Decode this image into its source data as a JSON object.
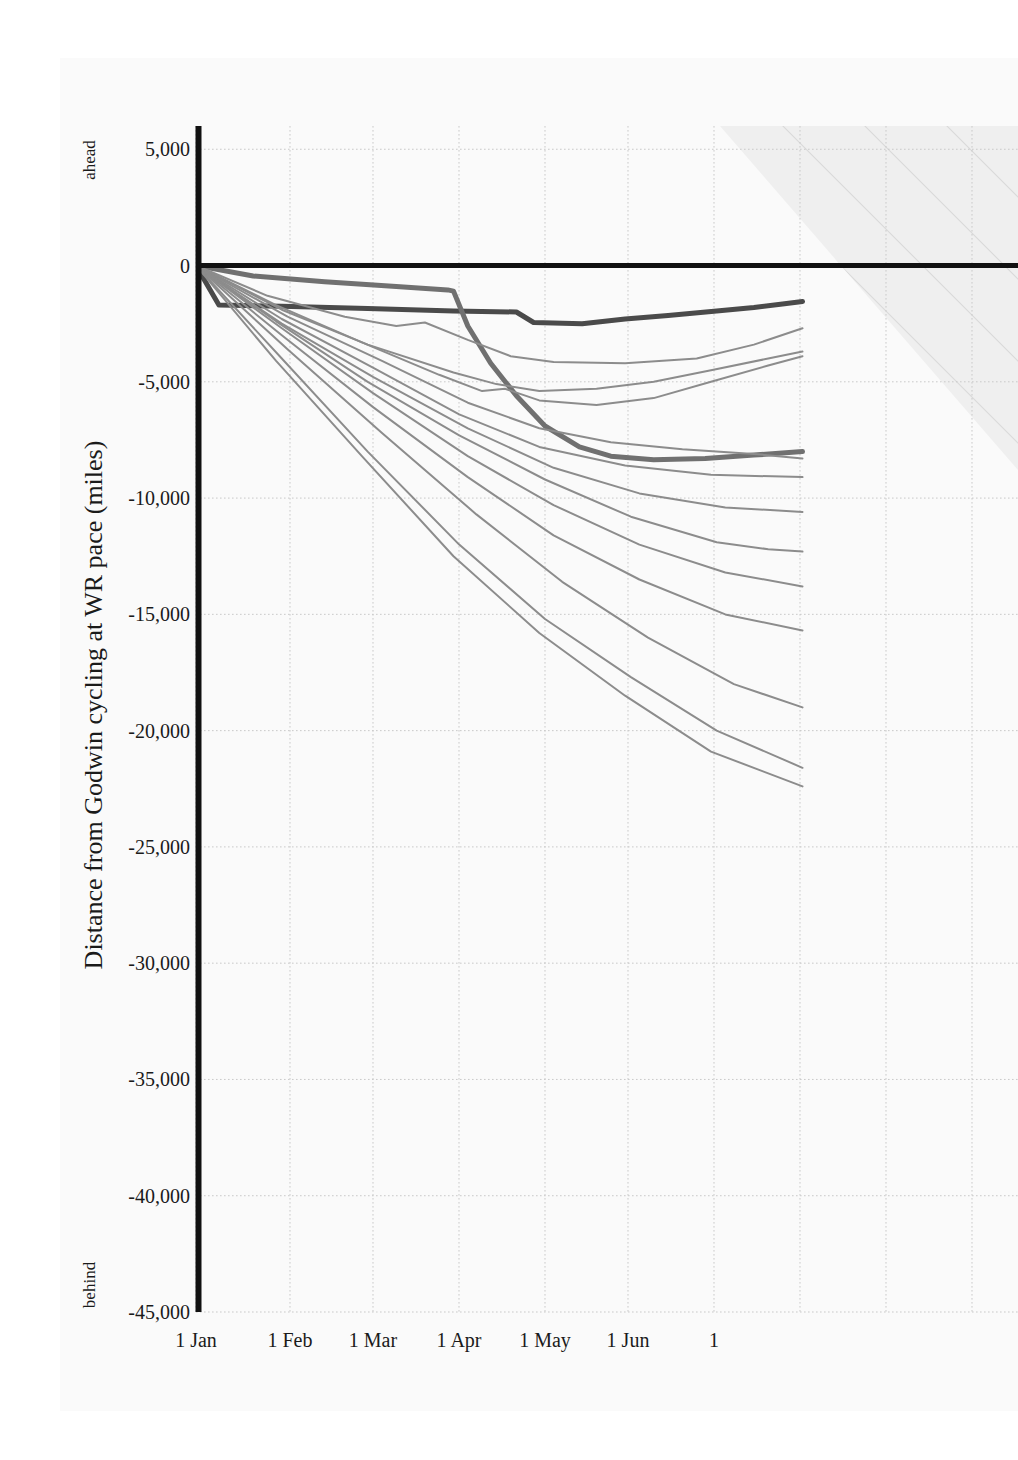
{
  "chart_data": {
    "type": "line",
    "title": "",
    "subtitle": "",
    "xlabel": "",
    "ylabel": "Distance from Godwin cycling at WR pace (miles)",
    "y_axis_top_note": "ahead",
    "y_axis_bottom_note": "behind",
    "x_ticklabels": [
      "1 Jan",
      "1 Feb",
      "1 Mar",
      "1 Apr",
      "1 May",
      "1 Jun",
      "1"
    ],
    "x_tick_positions_px": [
      196,
      290,
      373,
      459,
      545,
      628,
      714
    ],
    "y_ticklabels": [
      "5,000",
      "0",
      "-5,000",
      "-10,000",
      "-15,000",
      "-20,000",
      "-25,000",
      "-30,000",
      "-35,000",
      "-40,000",
      "-45,000"
    ],
    "y_tickvalues": [
      5000,
      0,
      -5000,
      -10000,
      -15000,
      -20000,
      -25000,
      -30000,
      -35000,
      -40000,
      -45000
    ],
    "ylim": [
      -45000,
      6000
    ],
    "xlim_labels": [
      "1 Jan",
      "beyond 1 Jul (clipped)"
    ],
    "grid": "dotted light grey, both axes",
    "legend": "none",
    "zero_reference_line": {
      "value": 0,
      "color": "#111111",
      "width_px": 5,
      "label": "World-record pace (Godwin)"
    },
    "shaded_region": {
      "description": "light grey hatched triangular band in upper-right, above/right of plot",
      "color": "#ededed",
      "hatch": "diagonal lines"
    },
    "colors": {
      "background": "#ffffff",
      "canvas": "#fafafa",
      "axis": "#111111",
      "grid": "#c9c9c9",
      "line_default": "#8c8c8c",
      "line_highlight_dark": "#4a4a4a",
      "line_highlight_mid": "#707070",
      "text": "#1a1a1a"
    },
    "series": [
      {
        "name": "highlighted-rider-dark",
        "emphasis": "high",
        "color": "#4a4a4a",
        "width_px": 5,
        "points": [
          [
            0,
            0
          ],
          [
            8,
            -1700
          ],
          [
            30,
            -1750
          ],
          [
            60,
            -1850
          ],
          [
            90,
            -1950
          ],
          [
            112,
            -2000
          ],
          [
            118,
            -2450
          ],
          [
            135,
            -2500
          ],
          [
            150,
            -2300
          ],
          [
            165,
            -2150
          ],
          [
            182,
            -1950
          ],
          [
            195,
            -1800
          ],
          [
            205,
            -1650
          ],
          [
            212,
            -1550
          ]
        ]
      },
      {
        "name": "highlighted-rider-mid",
        "emphasis": "high",
        "color": "#707070",
        "width_px": 5,
        "points": [
          [
            0,
            0
          ],
          [
            20,
            -450
          ],
          [
            45,
            -700
          ],
          [
            70,
            -900
          ],
          [
            88,
            -1050
          ],
          [
            90,
            -1100
          ],
          [
            95,
            -2600
          ],
          [
            103,
            -4200
          ],
          [
            112,
            -5600
          ],
          [
            122,
            -6900
          ],
          [
            134,
            -7800
          ],
          [
            145,
            -8200
          ],
          [
            160,
            -8350
          ],
          [
            178,
            -8300
          ],
          [
            195,
            -8150
          ],
          [
            212,
            -8000
          ]
        ]
      },
      {
        "name": "rider-03",
        "emphasis": "normal",
        "color": "#8c8c8c",
        "width_px": 2,
        "points": [
          [
            0,
            0
          ],
          [
            25,
            -1300
          ],
          [
            52,
            -2200
          ],
          [
            70,
            -2600
          ],
          [
            80,
            -2450
          ],
          [
            95,
            -3200
          ],
          [
            110,
            -3900
          ],
          [
            125,
            -4150
          ],
          [
            150,
            -4200
          ],
          [
            175,
            -4000
          ],
          [
            195,
            -3400
          ],
          [
            212,
            -2700
          ]
        ]
      },
      {
        "name": "rider-04",
        "emphasis": "normal",
        "color": "#8c8c8c",
        "width_px": 2,
        "points": [
          [
            0,
            0
          ],
          [
            30,
            -1900
          ],
          [
            60,
            -3400
          ],
          [
            90,
            -4600
          ],
          [
            105,
            -5100
          ],
          [
            120,
            -5400
          ],
          [
            140,
            -5300
          ],
          [
            160,
            -5000
          ],
          [
            180,
            -4500
          ],
          [
            200,
            -4000
          ],
          [
            212,
            -3700
          ]
        ]
      },
      {
        "name": "rider-05",
        "emphasis": "normal",
        "color": "#8c8c8c",
        "width_px": 2,
        "points": [
          [
            0,
            0
          ],
          [
            28,
            -1700
          ],
          [
            58,
            -3300
          ],
          [
            85,
            -4700
          ],
          [
            100,
            -5400
          ],
          [
            108,
            -5300
          ],
          [
            120,
            -5800
          ],
          [
            140,
            -6000
          ],
          [
            160,
            -5700
          ],
          [
            180,
            -5000
          ],
          [
            200,
            -4300
          ],
          [
            212,
            -3900
          ]
        ]
      },
      {
        "name": "rider-06",
        "emphasis": "normal",
        "color": "#8c8c8c",
        "width_px": 2,
        "points": [
          [
            0,
            0
          ],
          [
            32,
            -2200
          ],
          [
            65,
            -4100
          ],
          [
            95,
            -5900
          ],
          [
            120,
            -7000
          ],
          [
            145,
            -7600
          ],
          [
            170,
            -7900
          ],
          [
            195,
            -8100
          ],
          [
            212,
            -8300
          ]
        ]
      },
      {
        "name": "rider-07",
        "emphasis": "normal",
        "color": "#8c8c8c",
        "width_px": 2,
        "points": [
          [
            0,
            0
          ],
          [
            30,
            -2300
          ],
          [
            62,
            -4400
          ],
          [
            92,
            -6400
          ],
          [
            120,
            -7800
          ],
          [
            150,
            -8600
          ],
          [
            180,
            -9000
          ],
          [
            212,
            -9100
          ]
        ]
      },
      {
        "name": "rider-08",
        "emphasis": "normal",
        "color": "#8c8c8c",
        "width_px": 2,
        "points": [
          [
            0,
            0
          ],
          [
            30,
            -2500
          ],
          [
            62,
            -4800
          ],
          [
            95,
            -7000
          ],
          [
            125,
            -8700
          ],
          [
            155,
            -9800
          ],
          [
            185,
            -10400
          ],
          [
            212,
            -10600
          ]
        ]
      },
      {
        "name": "rider-09",
        "emphasis": "normal",
        "color": "#8c8c8c",
        "width_px": 2,
        "points": [
          [
            0,
            0
          ],
          [
            28,
            -2400
          ],
          [
            60,
            -5000
          ],
          [
            92,
            -7300
          ],
          [
            122,
            -9200
          ],
          [
            152,
            -10800
          ],
          [
            182,
            -11900
          ],
          [
            200,
            -12200
          ],
          [
            212,
            -12300
          ]
        ]
      },
      {
        "name": "rider-10",
        "emphasis": "normal",
        "color": "#8c8c8c",
        "width_px": 2,
        "points": [
          [
            0,
            0
          ],
          [
            30,
            -2700
          ],
          [
            62,
            -5500
          ],
          [
            95,
            -8200
          ],
          [
            125,
            -10300
          ],
          [
            155,
            -12000
          ],
          [
            185,
            -13200
          ],
          [
            212,
            -13800
          ]
        ]
      },
      {
        "name": "rider-11",
        "emphasis": "normal",
        "color": "#8c8c8c",
        "width_px": 2,
        "points": [
          [
            0,
            0
          ],
          [
            30,
            -3000
          ],
          [
            62,
            -6100
          ],
          [
            95,
            -9100
          ],
          [
            125,
            -11600
          ],
          [
            155,
            -13500
          ],
          [
            185,
            -15000
          ],
          [
            212,
            -15700
          ]
        ]
      },
      {
        "name": "rider-12",
        "emphasis": "normal",
        "color": "#8c8c8c",
        "width_px": 2,
        "points": [
          [
            0,
            0
          ],
          [
            32,
            -3600
          ],
          [
            65,
            -7200
          ],
          [
            98,
            -10700
          ],
          [
            128,
            -13600
          ],
          [
            158,
            -16000
          ],
          [
            188,
            -18000
          ],
          [
            212,
            -19000
          ]
        ]
      },
      {
        "name": "rider-13",
        "emphasis": "normal",
        "color": "#8c8c8c",
        "width_px": 2,
        "points": [
          [
            0,
            0
          ],
          [
            30,
            -4000
          ],
          [
            60,
            -8000
          ],
          [
            92,
            -12000
          ],
          [
            122,
            -15200
          ],
          [
            152,
            -17700
          ],
          [
            182,
            -20000
          ],
          [
            212,
            -21600
          ]
        ]
      },
      {
        "name": "rider-14",
        "emphasis": "normal",
        "color": "#8c8c8c",
        "width_px": 2,
        "points": [
          [
            0,
            0
          ],
          [
            28,
            -4100
          ],
          [
            58,
            -8200
          ],
          [
            90,
            -12500
          ],
          [
            120,
            -15800
          ],
          [
            150,
            -18500
          ],
          [
            180,
            -20900
          ],
          [
            212,
            -22400
          ]
        ]
      }
    ]
  },
  "axis": {
    "y_title": "Distance from Godwin cycling at WR pace (miles)",
    "ahead": "ahead",
    "behind": "behind"
  },
  "yticks": [
    {
      "label": "5,000",
      "value": 5000
    },
    {
      "label": "0",
      "value": 0
    },
    {
      "label": "-5,000",
      "value": -5000
    },
    {
      "label": "-10,000",
      "value": -10000
    },
    {
      "label": "-15,000",
      "value": -15000
    },
    {
      "label": "-20,000",
      "value": -20000
    },
    {
      "label": "-25,000",
      "value": -25000
    },
    {
      "label": "-30,000",
      "value": -30000
    },
    {
      "label": "-35,000",
      "value": -35000
    },
    {
      "label": "-40,000",
      "value": -40000
    },
    {
      "label": "-45,000",
      "value": -45000
    }
  ],
  "xticks": [
    {
      "label": "1 Jan",
      "x": 196
    },
    {
      "label": "1 Feb",
      "x": 290
    },
    {
      "label": "1 Mar",
      "x": 373
    },
    {
      "label": "1 Apr",
      "x": 459
    },
    {
      "label": "1 May",
      "x": 545
    },
    {
      "label": "1 Jun",
      "x": 628
    },
    {
      "label": "1",
      "x": 714
    }
  ]
}
